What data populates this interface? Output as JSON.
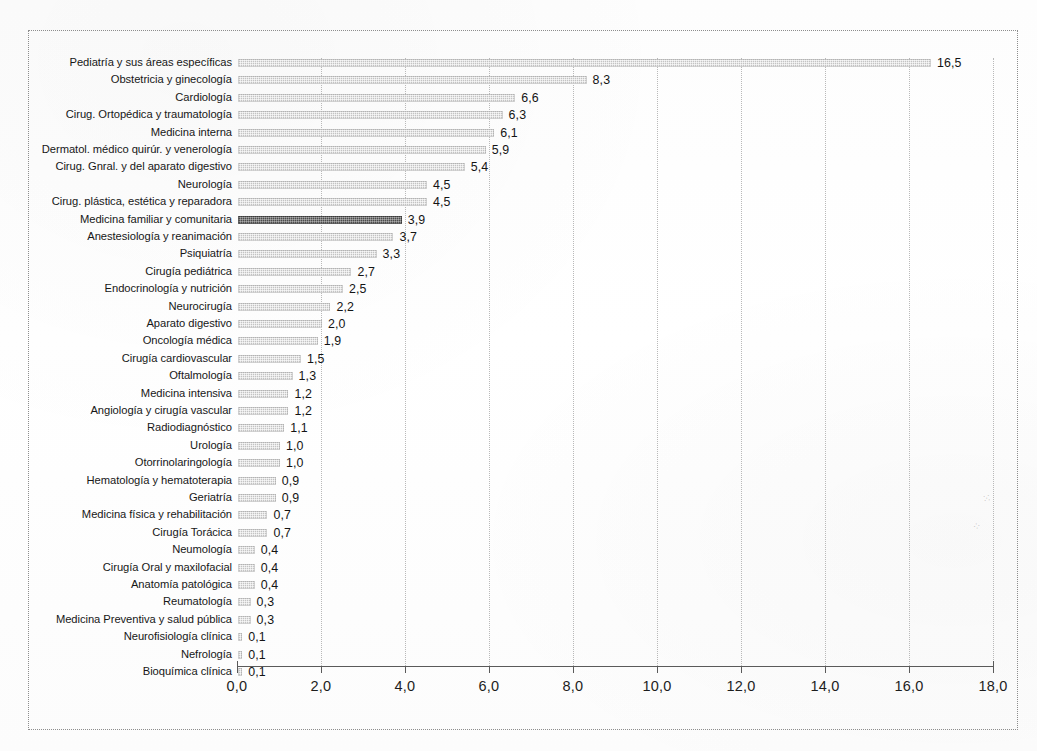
{
  "chart_data": {
    "type": "bar",
    "orientation": "horizontal",
    "title": "",
    "subtitle": "",
    "xlabel": "",
    "ylabel": "",
    "xlim": [
      0.0,
      18.0
    ],
    "xticks": [
      "0,0",
      "2,0",
      "4,0",
      "6,0",
      "8,0",
      "10,0",
      "12,0",
      "14,0",
      "16,0",
      "18,0"
    ],
    "xtick_values": [
      0,
      2,
      4,
      6,
      8,
      10,
      12,
      14,
      16,
      18
    ],
    "grid": "vertical-dotted",
    "legend": "none",
    "decimal_separator": ",",
    "highlight_category": "Medicina familiar y comunitaria",
    "categories": [
      "Pediatría y sus áreas específicas",
      "Obstetricia y ginecología",
      "Cardiología",
      "Cirug. Ortopédica y traumatología",
      "Medicina interna",
      "Dermatol. médico quirúr. y venerología",
      "Cirug. Gnral. y del aparato digestivo",
      "Neurología",
      "Cirug. plástica, estética y reparadora",
      "Medicina familiar y comunitaria",
      "Anestesiología y reanimación",
      "Psiquiatría",
      "Cirugía pediátrica",
      "Endocrinología y nutrición",
      "Neurocirugía",
      "Aparato digestivo",
      "Oncología médica",
      "Cirugía cardiovascular",
      "Oftalmología",
      "Medicina intensiva",
      "Angiología y cirugía vascular",
      "Radiodiagnóstico",
      "Urología",
      "Otorrinolaringología",
      "Hematología y hematoterapia",
      "Geriatría",
      "Medicina física y rehabilitación",
      "Cirugía Torácica",
      "Neumología",
      "Cirugía Oral y maxilofacial",
      "Anatomía patológica",
      "Reumatología",
      "Medicina Preventiva y salud pública",
      "Neurofisiología clínica",
      "Nefrología",
      "Bioquímica clínica"
    ],
    "values": [
      16.5,
      8.3,
      6.6,
      6.3,
      6.1,
      5.9,
      5.4,
      4.5,
      4.5,
      3.9,
      3.7,
      3.3,
      2.7,
      2.5,
      2.2,
      2.0,
      1.9,
      1.5,
      1.3,
      1.2,
      1.2,
      1.1,
      1.0,
      1.0,
      0.9,
      0.9,
      0.7,
      0.7,
      0.4,
      0.4,
      0.4,
      0.3,
      0.3,
      0.1,
      0.1,
      0.1
    ],
    "value_labels": [
      "16,5",
      "8,3",
      "6,6",
      "6,3",
      "6,1",
      "5,9",
      "5,4",
      "4,5",
      "4,5",
      "3,9",
      "3,7",
      "3,3",
      "2,7",
      "2,5",
      "2,2",
      "2,0",
      "1,9",
      "1,5",
      "1,3",
      "1,2",
      "1,2",
      "1,1",
      "1,0",
      "1,0",
      "0,9",
      "0,9",
      "0,7",
      "0,7",
      "0,4",
      "0,4",
      "0,4",
      "0,3",
      "0,3",
      "0,1",
      "0,1",
      "0,1"
    ],
    "colors": {
      "bar": "#c3c3c3",
      "bar_highlight": "#4c4c4c",
      "axis": "#5a5a5a",
      "grid": "#b9b9b9",
      "text": "#171717",
      "frame": "#8d8d8d",
      "background": "#ffffff"
    }
  }
}
